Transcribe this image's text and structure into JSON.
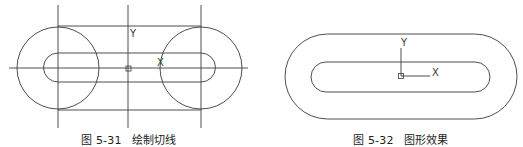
{
  "figures": [
    {
      "id": "fig-5-31",
      "caption_number": "图 5-31",
      "caption_title": "绘制切线",
      "axis_labels": {
        "x": "X",
        "y": "Y"
      }
    },
    {
      "id": "fig-5-32",
      "caption_number": "图 5-32",
      "caption_title": "图形效果",
      "axis_labels": {
        "x": "X",
        "y": "Y"
      }
    }
  ],
  "colors": {
    "line": "#3a3a3a",
    "text": "#222222",
    "background": "#ffffff"
  }
}
